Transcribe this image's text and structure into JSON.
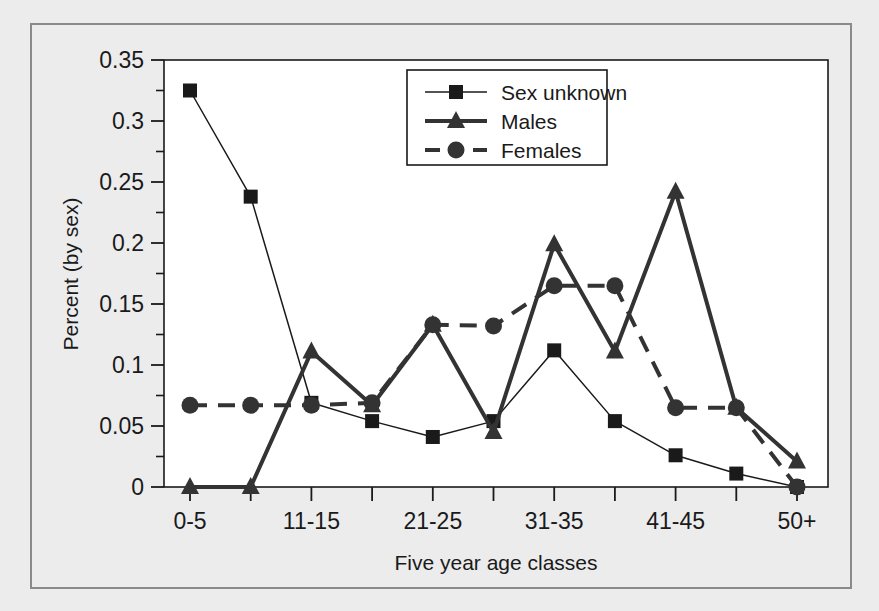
{
  "chart_data": {
    "type": "line",
    "title": "",
    "xlabel": "Five year age classes",
    "ylabel": "Percent (by sex)",
    "categories": [
      "0-5",
      "6-10",
      "11-15",
      "16-20",
      "21-25",
      "26-30",
      "31-35",
      "36-40",
      "41-45",
      "46-50",
      "50+"
    ],
    "tick_labels": [
      "0-5",
      "",
      "11-15",
      "",
      "21-25",
      "",
      "31-35",
      "",
      "41-45",
      "",
      "50+"
    ],
    "xlim": [
      0,
      10
    ],
    "ylim": [
      0,
      0.35
    ],
    "ytick_labels": [
      "0",
      "0.05",
      "0.1",
      "0.15",
      "0.2",
      "0.25",
      "0.3",
      "0.35"
    ],
    "ytick_values": [
      0,
      0.05,
      0.1,
      0.15,
      0.2,
      0.25,
      0.3,
      0.35
    ],
    "yminor_step": 0.025,
    "grid": false,
    "legend_position": "top-center",
    "series": [
      {
        "name": "Sex unknown",
        "marker": "square",
        "line_style": "solid",
        "line_width": 1.5,
        "color": "#1a1a1a",
        "values": [
          0.325,
          0.238,
          0.069,
          0.054,
          0.041,
          0.054,
          0.112,
          0.054,
          0.026,
          0.011,
          0.0
        ]
      },
      {
        "name": "Males",
        "marker": "triangle",
        "line_style": "solid",
        "line_width": 4,
        "color": "#333333",
        "values": [
          0.0,
          0.0,
          0.111,
          0.067,
          0.133,
          0.045,
          0.199,
          0.111,
          0.242,
          0.065,
          0.021
        ]
      },
      {
        "name": "Females",
        "marker": "circle",
        "line_style": "dashed",
        "line_width": 4,
        "color": "#333333",
        "values": [
          0.067,
          0.067,
          0.067,
          0.069,
          0.133,
          0.132,
          0.165,
          0.165,
          0.065,
          0.065,
          0.0
        ]
      }
    ]
  },
  "legend": {
    "items": [
      {
        "label": "Sex unknown"
      },
      {
        "label": "Males"
      },
      {
        "label": "Females"
      }
    ]
  },
  "colors": {
    "background": "#ececed",
    "plot_background": "#ffffff",
    "axis": "#1a1a1a",
    "frame": "#8a8a8a"
  }
}
